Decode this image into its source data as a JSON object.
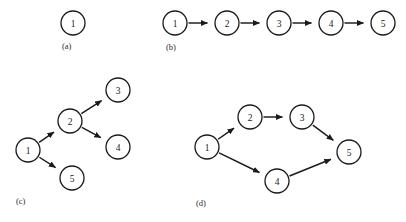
{
  "figure": {
    "background_color": "#ffffff",
    "stroke_color": "#1a1a1a",
    "node_radius": 12,
    "width": 406,
    "height": 222
  },
  "chart_data": {
    "type": "diagram",
    "title": "",
    "panels": [
      {
        "id": "a",
        "label": "(a)",
        "label_x": 62,
        "label_y": 46,
        "nodes": [
          {
            "id": "a1",
            "label": "1",
            "x": 73,
            "y": 23
          }
        ],
        "edges": []
      },
      {
        "id": "b",
        "label": "(b)",
        "label_x": 166,
        "label_y": 47,
        "nodes": [
          {
            "id": "b1",
            "label": "1",
            "x": 175,
            "y": 23
          },
          {
            "id": "b2",
            "label": "2",
            "x": 227,
            "y": 23
          },
          {
            "id": "b3",
            "label": "3",
            "x": 279,
            "y": 23
          },
          {
            "id": "b4",
            "label": "4",
            "x": 331,
            "y": 23
          },
          {
            "id": "b5",
            "label": "5",
            "x": 383,
            "y": 23
          }
        ],
        "edges": [
          {
            "from": "b1",
            "to": "b2"
          },
          {
            "from": "b2",
            "to": "b3"
          },
          {
            "from": "b3",
            "to": "b4"
          },
          {
            "from": "b4",
            "to": "b5"
          }
        ]
      },
      {
        "id": "c",
        "label": "(c)",
        "label_x": 16,
        "label_y": 201,
        "nodes": [
          {
            "id": "c1",
            "label": "1",
            "x": 28,
            "y": 150
          },
          {
            "id": "c2",
            "label": "2",
            "x": 70,
            "y": 121
          },
          {
            "id": "c3",
            "label": "3",
            "x": 118,
            "y": 90
          },
          {
            "id": "c4",
            "label": "4",
            "x": 118,
            "y": 147
          },
          {
            "id": "c5",
            "label": "5",
            "x": 72,
            "y": 178
          }
        ],
        "edges": [
          {
            "from": "c1",
            "to": "c2"
          },
          {
            "from": "c1",
            "to": "c5"
          },
          {
            "from": "c2",
            "to": "c3"
          },
          {
            "from": "c2",
            "to": "c4"
          }
        ]
      },
      {
        "id": "d",
        "label": "(d)",
        "label_x": 196,
        "label_y": 203,
        "nodes": [
          {
            "id": "d1",
            "label": "1",
            "x": 207,
            "y": 147
          },
          {
            "id": "d2",
            "label": "2",
            "x": 250,
            "y": 117
          },
          {
            "id": "d3",
            "label": "3",
            "x": 302,
            "y": 117
          },
          {
            "id": "d4",
            "label": "4",
            "x": 277,
            "y": 181
          },
          {
            "id": "d5",
            "label": "5",
            "x": 349,
            "y": 152
          }
        ],
        "edges": [
          {
            "from": "d1",
            "to": "d2"
          },
          {
            "from": "d2",
            "to": "d3"
          },
          {
            "from": "d3",
            "to": "d5"
          },
          {
            "from": "d1",
            "to": "d4"
          },
          {
            "from": "d4",
            "to": "d5"
          }
        ]
      }
    ]
  }
}
